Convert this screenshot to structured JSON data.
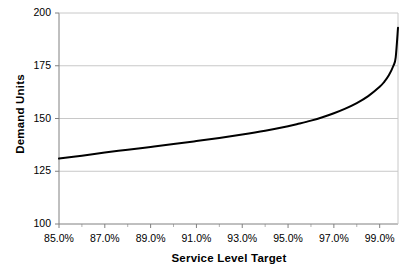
{
  "chart_data": {
    "type": "line",
    "title": "",
    "subtitle": "",
    "xlabel": "Service Level Target",
    "ylabel": "Demand Units",
    "xlim": [
      85.0,
      99.8
    ],
    "ylim": [
      100,
      200
    ],
    "xtick_labels": [
      "85.0%",
      "87.0%",
      "89.0%",
      "91.0%",
      "93.0%",
      "95.0%",
      "97.0%",
      "99.0%"
    ],
    "xtick_values": [
      85.0,
      87.0,
      89.0,
      91.0,
      93.0,
      95.0,
      97.0,
      99.0
    ],
    "ytick_labels": [
      "100",
      "125",
      "150",
      "175",
      "200"
    ],
    "ytick_values": [
      100,
      125,
      150,
      175,
      200
    ],
    "grid": "horizontal",
    "legend": "none",
    "series": [
      {
        "name": "Demand Units",
        "color": "#000000",
        "line_width": 2,
        "x": [
          85.0,
          86.0,
          87.0,
          88.0,
          89.0,
          90.0,
          91.0,
          92.0,
          93.0,
          94.0,
          95.0,
          95.5,
          96.0,
          96.5,
          97.0,
          97.5,
          98.0,
          98.5,
          99.0,
          99.2,
          99.4,
          99.6,
          99.7,
          99.8
        ],
        "values": [
          131.0,
          132.4,
          133.9,
          135.2,
          136.5,
          137.9,
          139.3,
          140.8,
          142.4,
          144.2,
          146.3,
          147.6,
          149.0,
          150.6,
          152.5,
          154.7,
          157.3,
          160.6,
          165.0,
          167.4,
          170.5,
          175.0,
          179.0,
          193.0
        ]
      }
    ],
    "annotations": []
  },
  "axis": {
    "y_title": "Demand Units",
    "x_title": "Service Level Target"
  }
}
